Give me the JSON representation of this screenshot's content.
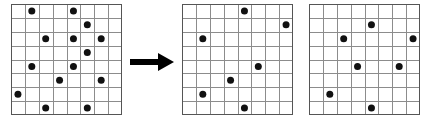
{
  "figure": {
    "background_color": "#ffffff",
    "grid_line_color": "#8c8c8c",
    "grid_border_color": "#555555",
    "dot_color": "#111111",
    "arrow_color": "#000000",
    "rows": 8,
    "cols": 8
  },
  "arrow": {
    "icon": "right-arrow-icon",
    "direction": "right",
    "label": "transforms into"
  },
  "panels": [
    {
      "id": "grid-input",
      "name": "input-grid",
      "label": "Input grid",
      "x": 11,
      "y": 4,
      "width": 111,
      "height": 111,
      "rows": 8,
      "cols": 8,
      "dot_count": 16,
      "dots": [
        {
          "row": 0,
          "col": 1
        },
        {
          "row": 0,
          "col": 4
        },
        {
          "row": 1,
          "col": 5
        },
        {
          "row": 2,
          "col": 2
        },
        {
          "row": 2,
          "col": 4
        },
        {
          "row": 2,
          "col": 6
        },
        {
          "row": 3,
          "col": 5
        },
        {
          "row": 4,
          "col": 1
        },
        {
          "row": 4,
          "col": 4
        },
        {
          "row": 5,
          "col": 3
        },
        {
          "row": 5,
          "col": 6
        },
        {
          "row": 6,
          "col": 0
        },
        {
          "row": 7,
          "col": 2
        },
        {
          "row": 7,
          "col": 5
        }
      ]
    },
    {
      "id": "grid-output-a",
      "name": "output-grid-a",
      "label": "Output grid A",
      "x": 182,
      "y": 4,
      "width": 111,
      "height": 111,
      "rows": 8,
      "cols": 8,
      "dot_count": 7,
      "dots": [
        {
          "row": 0,
          "col": 4
        },
        {
          "row": 1,
          "col": 7
        },
        {
          "row": 2,
          "col": 1
        },
        {
          "row": 4,
          "col": 5
        },
        {
          "row": 5,
          "col": 3
        },
        {
          "row": 6,
          "col": 1
        },
        {
          "row": 7,
          "col": 4
        }
      ]
    },
    {
      "id": "grid-output-b",
      "name": "output-grid-b",
      "label": "Output grid B",
      "x": 309,
      "y": 4,
      "width": 111,
      "height": 111,
      "rows": 8,
      "cols": 8,
      "dot_count": 7,
      "dots": [
        {
          "row": 1,
          "col": 4
        },
        {
          "row": 2,
          "col": 2
        },
        {
          "row": 2,
          "col": 7
        },
        {
          "row": 4,
          "col": 3
        },
        {
          "row": 4,
          "col": 6
        },
        {
          "row": 6,
          "col": 1
        },
        {
          "row": 7,
          "col": 4
        }
      ]
    }
  ]
}
